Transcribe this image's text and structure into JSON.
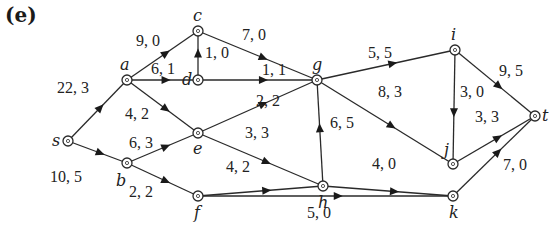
{
  "figure": {
    "panel_label": "(e)",
    "type": "flow network (capacity, flow)",
    "nodes": [
      {
        "id": "s",
        "label": "s",
        "x": 68,
        "y": 141,
        "lx": 52,
        "ly": 146
      },
      {
        "id": "a",
        "label": "a",
        "x": 127,
        "y": 80,
        "lx": 120,
        "ly": 70
      },
      {
        "id": "b",
        "label": "b",
        "x": 127,
        "y": 163,
        "lx": 116,
        "ly": 186
      },
      {
        "id": "c",
        "label": "c",
        "x": 198,
        "y": 31,
        "lx": 193,
        "ly": 21
      },
      {
        "id": "d",
        "label": "d",
        "x": 198,
        "y": 80,
        "lx": 182,
        "ly": 85
      },
      {
        "id": "e",
        "label": "e",
        "x": 198,
        "y": 133,
        "lx": 193,
        "ly": 154
      },
      {
        "id": "f",
        "label": "f",
        "x": 198,
        "y": 196,
        "lx": 194,
        "ly": 218
      },
      {
        "id": "g",
        "label": "g",
        "x": 317,
        "y": 80,
        "lx": 312,
        "ly": 70
      },
      {
        "id": "h",
        "label": "h",
        "x": 323,
        "y": 186,
        "lx": 318,
        "ly": 208
      },
      {
        "id": "i",
        "label": "i",
        "x": 455,
        "y": 50,
        "lx": 451,
        "ly": 40
      },
      {
        "id": "j",
        "label": "j",
        "x": 453,
        "y": 164,
        "lx": 444,
        "ly": 155
      },
      {
        "id": "k",
        "label": "k",
        "x": 453,
        "y": 196,
        "lx": 449,
        "ly": 218
      },
      {
        "id": "t",
        "label": "t",
        "x": 535,
        "y": 116,
        "lx": 542,
        "ly": 121
      }
    ],
    "edges": [
      {
        "from": "s",
        "to": "a",
        "label": "22, 3",
        "lx": 57,
        "ly": 93
      },
      {
        "from": "s",
        "to": "b",
        "label": "10, 5",
        "lx": 50,
        "ly": 182
      },
      {
        "from": "a",
        "to": "c",
        "label": "9, 0",
        "lx": 136,
        "ly": 46
      },
      {
        "from": "a",
        "to": "d",
        "label": "6, 1",
        "lx": 151,
        "ly": 74
      },
      {
        "from": "a",
        "to": "e",
        "label": "4, 2",
        "lx": 125,
        "ly": 119
      },
      {
        "from": "d",
        "to": "c",
        "label": "1, 0",
        "lx": 205,
        "ly": 58
      },
      {
        "from": "c",
        "to": "g",
        "label": "7, 0",
        "lx": 242,
        "ly": 40
      },
      {
        "from": "d",
        "to": "g",
        "label": "1, 1",
        "lx": 262,
        "ly": 75
      },
      {
        "from": "b",
        "to": "e",
        "label": "6, 3",
        "lx": 129,
        "ly": 148
      },
      {
        "from": "b",
        "to": "f",
        "label": "2, 2",
        "lx": 129,
        "ly": 197
      },
      {
        "from": "e",
        "to": "g",
        "label": "2, 2",
        "lx": 256,
        "ly": 106
      },
      {
        "from": "e",
        "to": "h",
        "label": "3, 3",
        "lx": 245,
        "ly": 138
      },
      {
        "from": "f",
        "to": "h",
        "label": "4, 2",
        "lx": 226,
        "ly": 172
      },
      {
        "from": "f",
        "to": "k",
        "label": "5, 0",
        "lx": 307,
        "ly": 218
      },
      {
        "from": "h",
        "to": "g",
        "label": "6, 5",
        "lx": 330,
        "ly": 128
      },
      {
        "from": "h",
        "to": "k",
        "label": "4, 0",
        "lx": 372,
        "ly": 169
      },
      {
        "from": "g",
        "to": "i",
        "label": "5, 5",
        "lx": 368,
        "ly": 58
      },
      {
        "from": "g",
        "to": "j",
        "label": "8, 3",
        "lx": 378,
        "ly": 97
      },
      {
        "from": "i",
        "to": "j",
        "label": "3, 0",
        "lx": 460,
        "ly": 97
      },
      {
        "from": "i",
        "to": "t",
        "label": "9, 5",
        "lx": 499,
        "ly": 76
      },
      {
        "from": "j",
        "to": "t",
        "label": "3, 3",
        "lx": 475,
        "ly": 122
      },
      {
        "from": "k",
        "to": "t",
        "label": "7, 0",
        "lx": 503,
        "ly": 170
      }
    ]
  }
}
